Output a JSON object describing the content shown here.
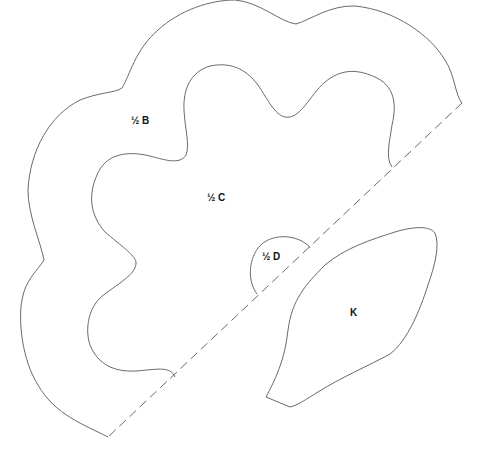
{
  "diagram": {
    "type": "sewing-pattern-template",
    "pieces": [
      {
        "id": "B",
        "label": "½ B",
        "description": "outer scalloped flower half, cut on fold"
      },
      {
        "id": "C",
        "label": "½ C",
        "description": "inner scalloped flower half, cut on fold"
      },
      {
        "id": "D",
        "label": "½ D",
        "description": "small semicircle center, cut on fold"
      },
      {
        "id": "K",
        "label": "K",
        "description": "leaf shape"
      }
    ],
    "fold_line": {
      "style": "dashed",
      "from": [
        462,
        103
      ],
      "to": [
        108,
        437
      ]
    },
    "colors": {
      "line": "#6a6a6a",
      "text": "#111111",
      "background": "#ffffff"
    }
  }
}
